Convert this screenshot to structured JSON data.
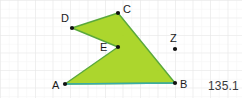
{
  "canvas": {
    "width": 242,
    "height": 98,
    "background": "#ffffff"
  },
  "grid": {
    "minor_spacing": 8.75,
    "major_spacing": 17.5,
    "minor_color": "#f2f2f2",
    "major_color": "#e4e4e4",
    "visible": true
  },
  "figure": {
    "name": "polygon-abcde",
    "fill_color": "#a8d422",
    "fill_opacity": 0.95,
    "stroke_color": "#5aa83c",
    "stroke_width": 1.4,
    "path": "65,84 118,47 72,28 118,13 175,83",
    "vertices": [
      {
        "id": "A",
        "label": "A",
        "x": 65,
        "y": 84,
        "label_x": 52,
        "label_y": 80,
        "dot": true
      },
      {
        "id": "E",
        "label": "E",
        "x": 118,
        "y": 47,
        "label_x": 100,
        "label_y": 42,
        "dot": true
      },
      {
        "id": "D",
        "label": "D",
        "x": 72,
        "y": 28,
        "label_x": 61,
        "label_y": 13,
        "dot": true
      },
      {
        "id": "C",
        "label": "C",
        "x": 118,
        "y": 13,
        "label_x": 123,
        "label_y": 4,
        "dot": true
      },
      {
        "id": "B",
        "label": "B",
        "x": 175,
        "y": 83,
        "label_x": 180,
        "label_y": 79,
        "dot": true
      }
    ],
    "highlighted_edge": {
      "name": "segment-ab",
      "from": "A",
      "to": "B",
      "color": "#3aada8",
      "width": 1.6
    }
  },
  "free_point": {
    "id": "Z",
    "label": "Z",
    "x": 175,
    "y": 49,
    "label_x": 170,
    "label_y": 33,
    "dot_color": "#111111"
  },
  "readout": {
    "name": "measurement-value",
    "value": "135.1"
  }
}
